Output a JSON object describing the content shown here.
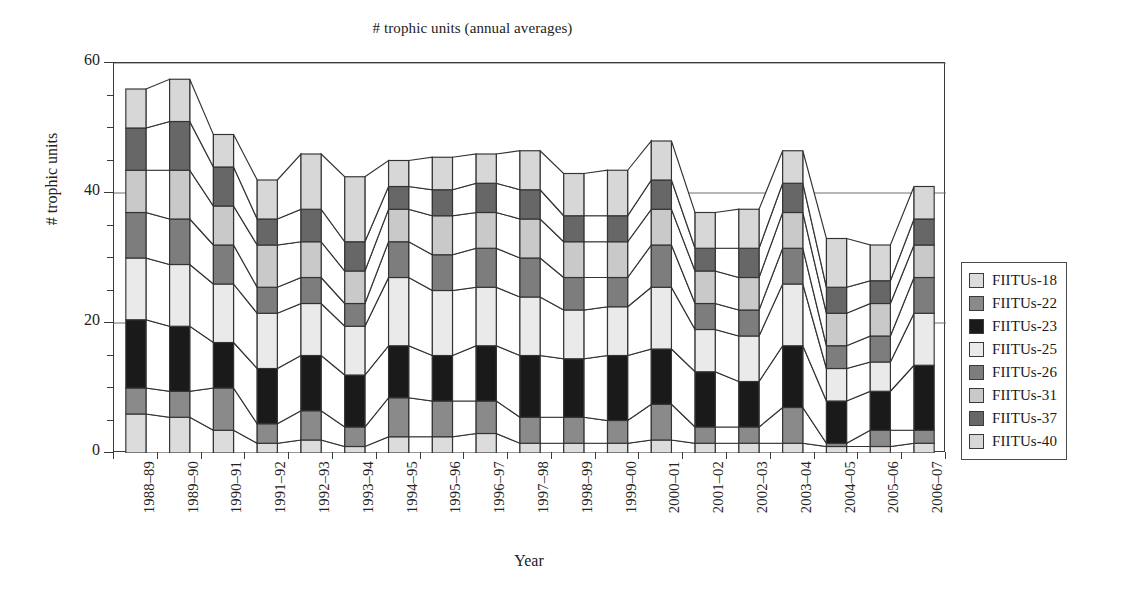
{
  "chart_data": {
    "type": "area",
    "title": "# trophic units (annual averages)",
    "xlabel": "Year",
    "ylabel": "# trophic units",
    "ylim": [
      0,
      60
    ],
    "ytick_major": [
      0,
      20,
      40,
      60
    ],
    "ytick_step_minor": 5,
    "grid": true,
    "legend_position": "right",
    "stacked": true,
    "categories": [
      "1988–89",
      "1989–90",
      "1990–91",
      "1991–92",
      "1992–93",
      "1993–94",
      "1994–95",
      "1995–96",
      "1996–97",
      "1997–98",
      "1998–99",
      "1999–00",
      "2000–01",
      "2001–02",
      "2002–03",
      "2003–04",
      "2004–05",
      "2005–06",
      "2006–07"
    ],
    "series": [
      {
        "name": "FIITUs-18",
        "color": "#dcdcdc",
        "values": [
          6.0,
          5.5,
          3.5,
          1.5,
          2.0,
          1.0,
          2.5,
          2.5,
          3.0,
          1.5,
          1.5,
          1.5,
          2.0,
          1.5,
          1.5,
          1.5,
          1.0,
          1.0,
          1.5
        ]
      },
      {
        "name": "FIITUs-22",
        "color": "#8a8a8a",
        "values": [
          4.0,
          4.0,
          6.5,
          3.0,
          4.5,
          3.0,
          6.0,
          5.5,
          5.0,
          4.0,
          4.0,
          3.5,
          5.5,
          2.5,
          2.5,
          5.5,
          0.5,
          2.5,
          2.0
        ]
      },
      {
        "name": "FIITUs-23",
        "color": "#1a1a1a",
        "values": [
          10.5,
          10.0,
          7.0,
          8.5,
          8.5,
          8.0,
          8.0,
          7.0,
          8.5,
          9.5,
          9.0,
          10.0,
          8.5,
          8.5,
          7.0,
          9.5,
          6.5,
          6.0,
          10.0
        ]
      },
      {
        "name": "FIITUs-25",
        "color": "#eaeaea",
        "values": [
          9.5,
          9.5,
          9.0,
          8.5,
          8.0,
          7.5,
          10.5,
          10.0,
          9.0,
          9.0,
          7.5,
          7.5,
          9.5,
          6.5,
          7.0,
          9.5,
          5.0,
          4.5,
          8.0
        ]
      },
      {
        "name": "FIITUs-26",
        "color": "#7d7d7d",
        "values": [
          7.0,
          7.0,
          6.0,
          4.0,
          4.0,
          3.5,
          5.5,
          5.5,
          6.0,
          6.0,
          5.0,
          4.5,
          6.5,
          4.0,
          4.0,
          5.5,
          3.5,
          4.0,
          5.5
        ]
      },
      {
        "name": "FIITUs-31",
        "color": "#c9c9c9",
        "values": [
          6.5,
          7.5,
          6.0,
          6.5,
          5.5,
          5.0,
          5.0,
          6.0,
          5.5,
          6.0,
          5.5,
          5.5,
          5.5,
          5.0,
          5.0,
          5.5,
          5.0,
          5.0,
          5.0
        ]
      },
      {
        "name": "FIITUs-37",
        "color": "#676767",
        "values": [
          6.5,
          7.5,
          6.0,
          4.0,
          5.0,
          4.5,
          3.5,
          4.0,
          4.5,
          4.5,
          4.0,
          4.0,
          4.5,
          3.5,
          4.5,
          4.5,
          4.0,
          3.5,
          4.0
        ]
      },
      {
        "name": "FIITUs-40",
        "color": "#d7d7d7",
        "values": [
          6.0,
          6.5,
          5.0,
          6.0,
          8.5,
          10.0,
          4.0,
          5.0,
          4.5,
          6.0,
          6.5,
          7.0,
          6.0,
          5.5,
          6.0,
          5.0,
          7.5,
          5.5,
          5.0
        ]
      }
    ],
    "totals": [
      56.0,
      57.5,
      49.0,
      42.0,
      46.0,
      42.5,
      45.0,
      45.5,
      46.0,
      46.5,
      43.0,
      43.5,
      48.0,
      37.0,
      37.5,
      46.5,
      33.0,
      32.0,
      41.0
    ]
  },
  "legend": {
    "items": [
      {
        "label": "FIITUs-18"
      },
      {
        "label": "FIITUs-22"
      },
      {
        "label": "FIITUs-23"
      },
      {
        "label": "FIITUs-25"
      },
      {
        "label": "FIITUs-26"
      },
      {
        "label": "FIITUs-31"
      },
      {
        "label": "FIITUs-37"
      },
      {
        "label": "FIITUs-40"
      }
    ]
  },
  "style": {
    "axis_color": "#3a3a3a",
    "grid_color": "#6e6e6e",
    "outline_color": "#333333",
    "text_color": "#1a1a1a"
  }
}
